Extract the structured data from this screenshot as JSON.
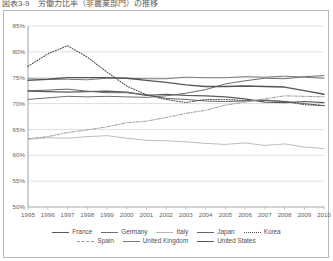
{
  "figure": {
    "title": "図表3-9　労働力比率（非農業部門）の推移"
  },
  "chart_data": {
    "type": "line",
    "title": "",
    "xlabel": "",
    "ylabel": "",
    "ylim": [
      50,
      85
    ],
    "xlim": [
      1995,
      2010
    ],
    "ytick_format": "percent",
    "grid": true,
    "legend_position": "bottom",
    "yticks": [
      "85%",
      "80%",
      "75%",
      "70%",
      "65%",
      "60%",
      "55%",
      "50%"
    ],
    "ytick_values": [
      85,
      80,
      75,
      70,
      65,
      60,
      55,
      50
    ],
    "categories": [
      1995,
      1996,
      1997,
      1998,
      1999,
      2000,
      2001,
      2002,
      2003,
      2004,
      2005,
      2006,
      2007,
      2008,
      2009,
      2010
    ],
    "xticks": [
      "1995",
      "1996",
      "1997",
      "1998",
      "1999",
      "2000",
      "2001",
      "2002",
      "2003",
      "2004",
      "2005",
      "2006",
      "2007",
      "2008",
      "2009",
      "2010"
    ],
    "series": [
      {
        "name": "France",
        "color": "#5a5a5a",
        "style": "solid",
        "width": 1.25,
        "values": [
          72.4,
          72.3,
          72.2,
          72.3,
          72.4,
          72.2,
          71.6,
          71.8,
          71.6,
          71.5,
          71.3,
          70.9,
          70.3,
          70.2,
          70.4,
          70.2
        ]
      },
      {
        "name": "Germany",
        "color": "#6e6e6e",
        "style": "solid",
        "width": 1.0,
        "values": [
          70.8,
          71.1,
          71.4,
          71.3,
          71.4,
          71.3,
          71.2,
          71.5,
          72.0,
          72.7,
          73.8,
          74.4,
          74.9,
          74.8,
          75.2,
          75.4
        ]
      },
      {
        "name": "Italy",
        "color": "#b5b5b5",
        "style": "solid",
        "width": 0.9,
        "values": [
          63.1,
          63.4,
          63.3,
          63.6,
          63.8,
          63.3,
          62.9,
          62.8,
          62.6,
          62.3,
          62.1,
          62.4,
          61.9,
          62.2,
          61.6,
          61.3
        ]
      },
      {
        "name": "Japan",
        "color": "#666666",
        "style": "solid",
        "width": 1.0,
        "values": [
          72.5,
          72.6,
          72.8,
          72.4,
          72.1,
          72.1,
          71.7,
          71.0,
          70.8,
          70.5,
          70.4,
          70.5,
          70.6,
          70.4,
          70.0,
          69.6
        ]
      },
      {
        "name": "Korea",
        "color": "#4f4f4f",
        "style": "dotted",
        "width": 1.1,
        "values": [
          77.2,
          79.6,
          81.2,
          79.0,
          76.1,
          73.4,
          71.7,
          70.8,
          70.2,
          70.8,
          70.8,
          70.6,
          70.7,
          70.4,
          69.8,
          69.6
        ]
      },
      {
        "name": "Spain",
        "color": "#9a9a9a",
        "style": "dashdot",
        "width": 1.0,
        "values": [
          63.2,
          63.6,
          64.4,
          64.9,
          65.5,
          66.3,
          66.6,
          67.3,
          68.1,
          68.7,
          69.7,
          70.3,
          70.9,
          71.5,
          71.4,
          71.3
        ]
      },
      {
        "name": "United Kingdom",
        "color": "#7a7a7a",
        "style": "solid",
        "width": 1.0,
        "values": [
          74.8,
          74.7,
          74.7,
          74.6,
          74.9,
          74.9,
          74.8,
          74.8,
          75.1,
          75.0,
          75.0,
          75.2,
          75.1,
          75.3,
          75.1,
          74.9
        ]
      },
      {
        "name": "United States",
        "color": "#555555",
        "style": "solid",
        "width": 1.3,
        "values": [
          74.5,
          74.7,
          75.0,
          75.0,
          75.0,
          74.9,
          74.5,
          74.1,
          73.6,
          73.3,
          73.3,
          73.4,
          73.3,
          73.2,
          72.5,
          71.8
        ]
      }
    ]
  },
  "legend": {
    "rows": [
      [
        "France",
        "Germany",
        "Italy",
        "Japan",
        "Korea"
      ],
      [
        "Spain",
        "United Kingdom",
        "United States"
      ]
    ]
  }
}
